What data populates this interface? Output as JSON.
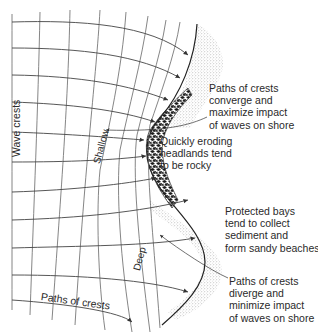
{
  "diagram": {
    "topic": "Wave refraction at headlands and bays",
    "colors": {
      "lines": "#555555",
      "shore": "#222222",
      "sand": "#9a9a9a",
      "rock": "#1a1a1a",
      "text": "#2a2a2a"
    },
    "labels": {
      "wave_crests": "Wave crests",
      "shallow": "Shallow",
      "deep": "Deep",
      "paths_of_crests": "Paths of crests",
      "converge": "Paths of crests\nconverge and\nmaximize impact\nof waves on shore",
      "headlands": "Quickly eroding\nheadlands tend\nto be rocky",
      "bays": "Protected bays\ntend to collect\nsediment and\nform sandy beaches",
      "diverge": "Paths of crests\ndiverge and\nminimize impact\nof waves on shore"
    },
    "features": [
      {
        "name": "rocky-headland",
        "description": "Rocky headland where wave energy converges"
      },
      {
        "name": "sandy-beach-upper",
        "description": "Sandy sediment along upper bay"
      },
      {
        "name": "sandy-beach-lower",
        "description": "Sandy beach in protected bay"
      }
    ]
  }
}
